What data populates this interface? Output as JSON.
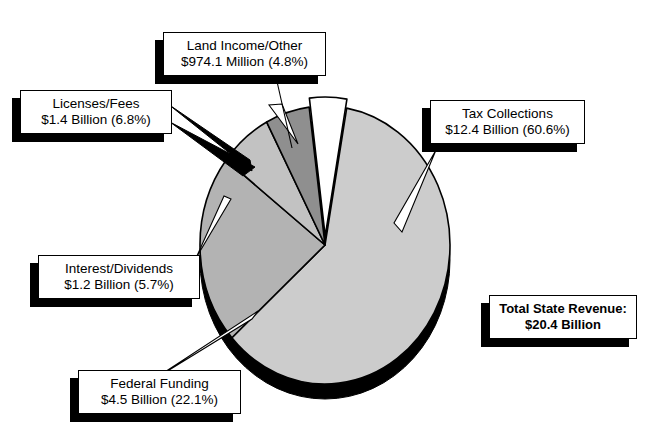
{
  "chart_data": {
    "type": "pie",
    "title": "",
    "total_label": "Total State Revenue:",
    "total_value": "$20.4 Billion",
    "legend_position": "callouts",
    "slices": [
      {
        "name": "Tax Collections",
        "label": "Tax Collections",
        "value_label": "$12.4 Billion (60.6%)",
        "value": 12.4,
        "percent": 60.6,
        "unit": "Billion",
        "color": "#cccccc",
        "exploded": false
      },
      {
        "name": "Federal Funding",
        "label": "Federal Funding",
        "value_label": "$4.5 Billion (22.1%)",
        "value": 4.5,
        "percent": 22.1,
        "unit": "Billion",
        "color": "#b3b3b3",
        "exploded": false
      },
      {
        "name": "Licenses/Fees",
        "label": "Licenses/Fees",
        "value_label": "$1.4 Billion (6.8%)",
        "value": 1.4,
        "percent": 6.8,
        "unit": "Billion",
        "color": "#c2c2c2",
        "exploded": false
      },
      {
        "name": "Interest/Dividends",
        "label": "Interest/Dividends",
        "value_label": "$1.2 Billion (5.7%)",
        "value": 1.2,
        "percent": 5.7,
        "unit": "Billion",
        "color": "#8f8f8f",
        "exploded": false
      },
      {
        "name": "Land Income/Other",
        "label": "Land Income/Other",
        "value_label": "$974.1 Million (4.8%)",
        "value": 0.9741,
        "percent": 4.8,
        "unit": "Million",
        "color": "#ffffff",
        "exploded": true
      }
    ],
    "geometry": {
      "cx": 325,
      "cy": 245,
      "rx": 125,
      "ry": 139,
      "depth": 15,
      "start_angle_deg": -80,
      "direction": "clockwise",
      "explode_offset": 9,
      "edge_color": "#000000",
      "depth_color": "#000000"
    }
  },
  "callouts": {
    "land": {
      "line1": "Land Income/Other",
      "line2": "$974.1 Million (4.8%)"
    },
    "lic": {
      "line1": "Licenses/Fees",
      "line2": "$1.4 Billion (6.8%)"
    },
    "tax": {
      "line1": "Tax Collections",
      "line2": "$12.4 Billion (60.6%)"
    },
    "int": {
      "line1": "Interest/Dividends",
      "line2": "$1.2 Billion (5.7%)"
    },
    "fed": {
      "line1": "Federal Funding",
      "line2": "$4.5 Billion (22.1%)"
    },
    "total": {
      "line1": "Total State Revenue:",
      "line2": "$20.4 Billion"
    }
  }
}
